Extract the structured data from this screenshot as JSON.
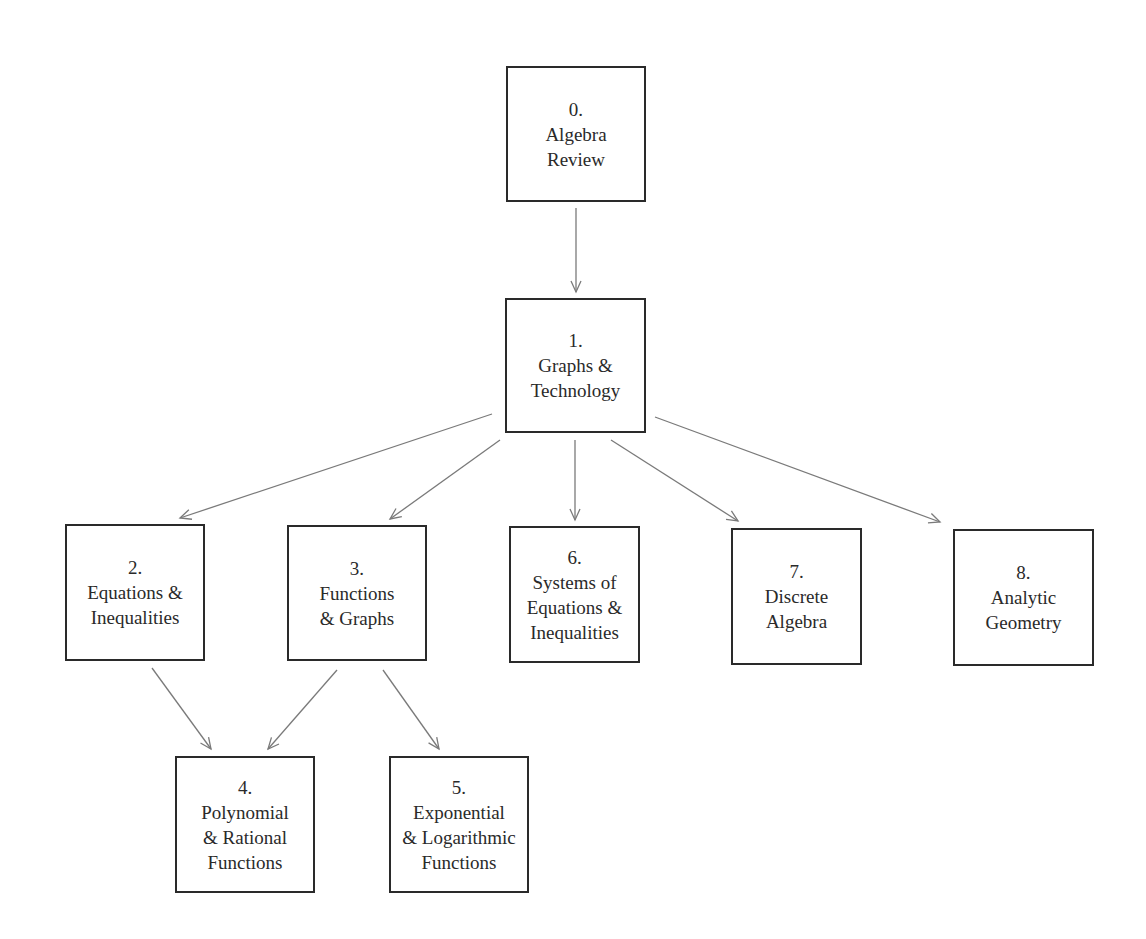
{
  "diagram": {
    "type": "flowchart",
    "nodes": [
      {
        "id": "n0",
        "number": "0.",
        "lines": [
          "Algebra",
          "Review"
        ],
        "box": [
          506,
          66,
          140,
          136
        ]
      },
      {
        "id": "n1",
        "number": "1.",
        "lines": [
          "Graphs &",
          "Technology"
        ],
        "box": [
          505,
          298,
          141,
          135
        ]
      },
      {
        "id": "n2",
        "number": "2.",
        "lines": [
          "Equations &",
          "Inequalities"
        ],
        "box": [
          65,
          524,
          140,
          137
        ]
      },
      {
        "id": "n3",
        "number": "3.",
        "lines": [
          "Functions",
          "& Graphs"
        ],
        "box": [
          287,
          525,
          140,
          136
        ]
      },
      {
        "id": "n6",
        "number": "6.",
        "lines": [
          "Systems of",
          "Equations &",
          "Inequalities"
        ],
        "box": [
          509,
          526,
          131,
          137
        ]
      },
      {
        "id": "n7",
        "number": "7.",
        "lines": [
          "Discrete",
          "Algebra"
        ],
        "box": [
          731,
          528,
          131,
          137
        ]
      },
      {
        "id": "n8",
        "number": "8.",
        "lines": [
          "Analytic",
          "Geometry"
        ],
        "box": [
          953,
          529,
          141,
          137
        ]
      },
      {
        "id": "n4",
        "number": "4.",
        "lines": [
          "Polynomial",
          "& Rational",
          "Functions"
        ],
        "box": [
          175,
          756,
          140,
          137
        ]
      },
      {
        "id": "n5",
        "number": "5.",
        "lines": [
          "Exponential",
          "& Logarithmic",
          "Functions"
        ],
        "box": [
          389,
          756,
          140,
          137
        ]
      }
    ],
    "edges": [
      {
        "from": "n0",
        "to": "n1",
        "line": [
          576,
          208,
          576,
          292
        ]
      },
      {
        "from": "n1",
        "to": "n2",
        "line": [
          492,
          414,
          180,
          518
        ]
      },
      {
        "from": "n1",
        "to": "n3",
        "line": [
          500,
          440,
          390,
          519
        ]
      },
      {
        "from": "n1",
        "to": "n6",
        "line": [
          575,
          440,
          575,
          520
        ]
      },
      {
        "from": "n1",
        "to": "n7",
        "line": [
          611,
          440,
          738,
          521
        ]
      },
      {
        "from": "n1",
        "to": "n8",
        "line": [
          655,
          417,
          940,
          522
        ]
      },
      {
        "from": "n2",
        "to": "n4",
        "line": [
          152,
          668,
          211,
          749
        ]
      },
      {
        "from": "n3",
        "to": "n4",
        "line": [
          337,
          670,
          268,
          749
        ]
      },
      {
        "from": "n3",
        "to": "n5",
        "line": [
          383,
          670,
          439,
          749
        ]
      }
    ],
    "colors": {
      "box_border": "#2a2a2a",
      "arrow": "#7a7a7a",
      "text": "#2a2a2a",
      "background": "#ffffff"
    }
  }
}
